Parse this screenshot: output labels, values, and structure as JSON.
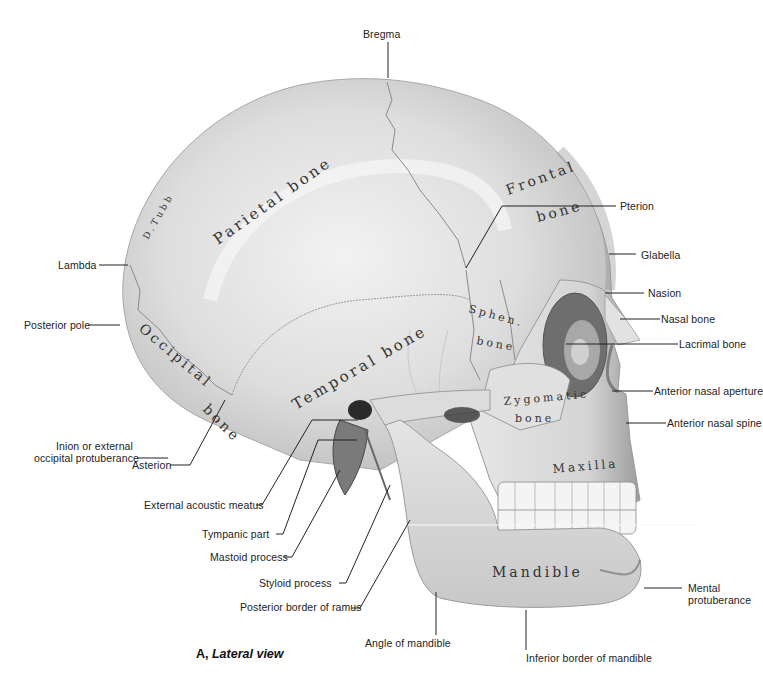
{
  "figure": {
    "caption_prefix": "A,",
    "caption_title": "Lateral view",
    "signature": "D.Tubb"
  },
  "bone_names": {
    "parietal": "Parietal bone",
    "frontal_1": "Frontal",
    "frontal_2": "bone",
    "temporal": "Temporal bone",
    "occipital_1": "Occipital",
    "occipital_2": "bone",
    "sphenoid_1": "Sphen.",
    "sphenoid_2": "bone",
    "zygomatic_1": "Zygomatic",
    "zygomatic_2": "bone",
    "maxilla": "Maxilla",
    "mandible": "Mandible"
  },
  "labels": {
    "bregma": "Bregma",
    "pterion": "Pterion",
    "glabella": "Glabella",
    "nasion": "Nasion",
    "nasal_bone": "Nasal bone",
    "lacrimal_bone": "Lacrimal bone",
    "anterior_nasal_aperture": "Anterior nasal aperture",
    "anterior_nasal_spine": "Anterior nasal spine",
    "mental_protuberance_1": "Mental",
    "mental_protuberance_2": "protuberance",
    "lambda": "Lambda",
    "posterior_pole": "Posterior pole",
    "inion_1": "Inion or external",
    "inion_2": "occipital protuberance",
    "asterion": "Asterion",
    "external_acoustic_meatus": "External acoustic meatus",
    "tympanic_part": "Tympanic part",
    "mastoid_process": "Mastoid process",
    "styloid_process": "Styloid process",
    "posterior_border_ramus": "Posterior border of ramus",
    "angle_of_mandible": "Angle of mandible",
    "inferior_border_mandible": "Inferior border of mandible"
  }
}
